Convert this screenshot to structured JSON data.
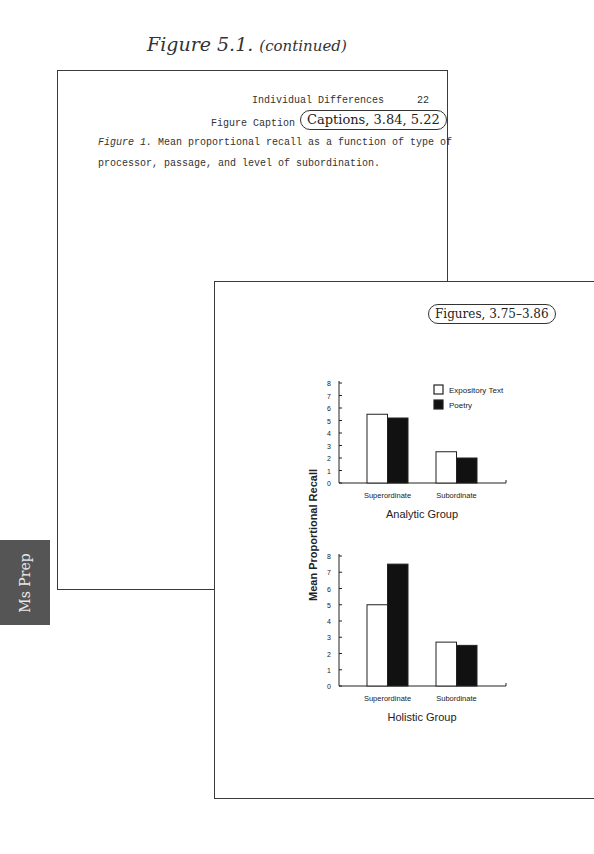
{
  "heading": {
    "figure_number": "Figure 5.1.",
    "continued": "(continued)"
  },
  "back_page": {
    "running_head": "Individual Differences",
    "page_number": "22",
    "caption_label": "Figure Caption",
    "caption_italic": "Figure 1.",
    "caption_line1_rest": " Mean proportional recall as a function of type of",
    "caption_line2": "processor, passage, and level of subordination.",
    "callout": "Captions, 3.84, 5.22"
  },
  "front_page": {
    "callout": "Figures, 3.75–3.86"
  },
  "side_tab": {
    "label": "Ms Prep",
    "color": "#555555"
  },
  "chart_data": [
    {
      "type": "bar",
      "title": "Analytic Group",
      "xlabel": "Analytic Group",
      "ylabel": "Mean Proportional Recall",
      "categories": [
        "Superordinate",
        "Subordinate"
      ],
      "series": [
        {
          "name": "Expository Text",
          "color": "#ffffff",
          "values": [
            5.5,
            2.5
          ]
        },
        {
          "name": "Poetry",
          "color": "#111111",
          "values": [
            5.2,
            2.0
          ]
        }
      ],
      "ylim": [
        0,
        8
      ],
      "yticks": [
        0,
        1,
        2,
        3,
        4,
        5,
        6,
        7,
        8
      ],
      "grid": false,
      "legend_position": "upper right"
    },
    {
      "type": "bar",
      "title": "Holistic Group",
      "xlabel": "Holistic Group",
      "ylabel": "Mean Proportional Recall",
      "categories": [
        "Superordinate",
        "Subordinate"
      ],
      "series": [
        {
          "name": "Expository Text",
          "color": "#ffffff",
          "values": [
            5.0,
            2.7
          ]
        },
        {
          "name": "Poetry",
          "color": "#111111",
          "values": [
            7.5,
            2.5
          ]
        }
      ],
      "ylim": [
        0,
        8
      ],
      "yticks": [
        0,
        1,
        2,
        3,
        4,
        5,
        6,
        7,
        8
      ],
      "grid": false
    }
  ],
  "legend": {
    "items": [
      "Expository Text",
      "Poetry"
    ]
  },
  "shared_ylabel": "Mean Proportional Recall"
}
